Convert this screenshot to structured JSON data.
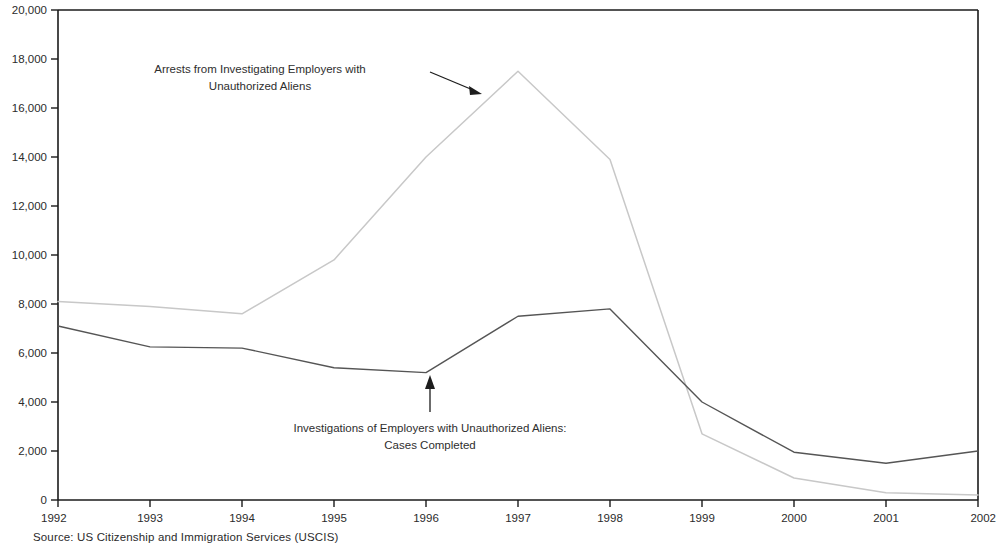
{
  "source_note": "Source: US Citizenship and Immigration Services (USCIS)",
  "annotations": {
    "arrests": {
      "line1": "Arrests from Investigating Employers with",
      "line2": "Unauthorized Aliens"
    },
    "investigations": {
      "line1": "Investigations of Employers with Unauthorized Aliens:",
      "line2": "Cases Completed"
    }
  },
  "colors": {
    "arrests_line": "#c8c8c8",
    "investigations_line": "#555555",
    "axis": "#1a1a1a",
    "text": "#2b2b2b"
  },
  "chart_data": {
    "type": "line",
    "title": "",
    "xlabel": "",
    "ylabel": "",
    "xlim": [
      1992,
      2002
    ],
    "ylim": [
      0,
      20000
    ],
    "ytick_step": 2000,
    "grid": false,
    "legend": "annotations-inline",
    "x": [
      1992,
      1993,
      1994,
      1995,
      1996,
      1997,
      1998,
      1999,
      2000,
      2001,
      2002
    ],
    "categories": [
      "1992",
      "1993",
      "1994",
      "1995",
      "1996",
      "1997",
      "1998",
      "1999",
      "2000",
      "2001",
      "2002"
    ],
    "ytick_labels": [
      "0",
      "2,000",
      "4,000",
      "6,000",
      "8,000",
      "10,000",
      "12,000",
      "14,000",
      "16,000",
      "18,000",
      "20,000"
    ],
    "ytick_values": [
      0,
      2000,
      4000,
      6000,
      8000,
      10000,
      12000,
      14000,
      16000,
      18000,
      20000
    ],
    "series": [
      {
        "name": "Arrests from Investigating Employers with Unauthorized Aliens",
        "color": "#c8c8c8",
        "values": [
          8100,
          7900,
          7600,
          9800,
          14000,
          17500,
          13900,
          2700,
          900,
          300,
          200
        ]
      },
      {
        "name": "Investigations of Employers with Unauthorized Aliens: Cases Completed",
        "color": "#555555",
        "values": [
          7100,
          6250,
          6200,
          5400,
          5200,
          7500,
          7800,
          4000,
          1950,
          1500,
          2000
        ]
      }
    ]
  }
}
